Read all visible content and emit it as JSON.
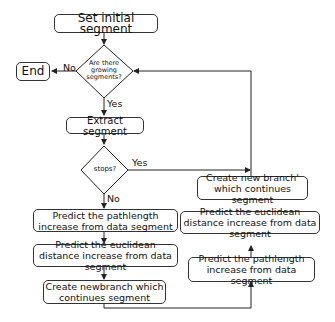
{
  "diagram": {
    "type": "flowchart",
    "nodes": {
      "start": "Set initial segment",
      "end": "End",
      "decision_growing": "Are there growing segments?",
      "extract": "Extract segment",
      "decision_stops": "stops?",
      "left_predict_path": "Predict the pathlength increase from data segment",
      "left_predict_euclid": "Predict the euclidean distance increase from data segment",
      "left_create": "Create newbranch which continues segment",
      "right_create": "Create new branch' which continues segment",
      "right_predict_euclid": "Predict the euclidean distance increase from data segment",
      "right_predict_path": "Predict the pathlength increase from data segment"
    },
    "edge_labels": {
      "growing_no": "No",
      "growing_yes": "Yes",
      "stops_yes": "Yes",
      "stops_no": "No"
    }
  }
}
